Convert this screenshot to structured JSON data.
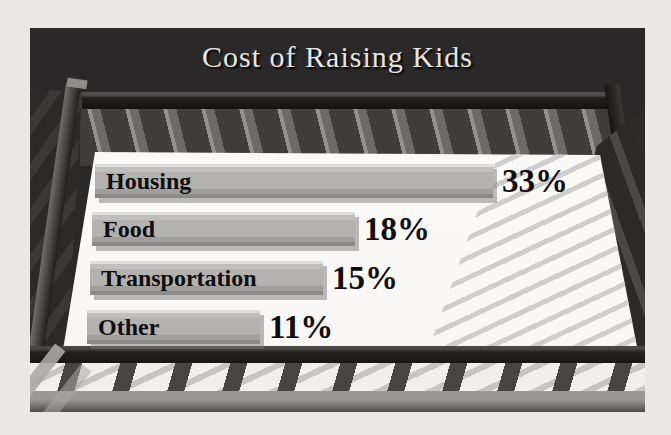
{
  "page": {
    "background_color": "#e9e8e6",
    "illustration_background": "#2b2829"
  },
  "chart_data": {
    "type": "bar",
    "orientation": "horizontal",
    "title": "Cost of Raising Kids",
    "categories": [
      "Housing",
      "Food",
      "Transportation",
      "Other"
    ],
    "values": [
      33,
      18,
      15,
      11
    ],
    "value_labels": [
      "33%",
      "18%",
      "15%",
      "11%"
    ],
    "xlabel": "",
    "ylabel": "",
    "legend": "none",
    "grid": false,
    "layout_hints": {
      "bar_lefts_px": [
        65,
        62,
        60,
        57
      ],
      "bar_tops_px": [
        133,
        181,
        230,
        279
      ],
      "bar_widths_px": [
        398,
        263,
        233,
        173
      ],
      "theme": "baby-crib illustration, white mattress plot area, gray beveled bars"
    },
    "colors": {
      "bar_fill": "#b3b2b0",
      "bar_text": "#0e0d0b",
      "title_text": "#e6e5e3",
      "mattress": "#fbfaf8",
      "crib_dark": "#2b2829"
    }
  }
}
